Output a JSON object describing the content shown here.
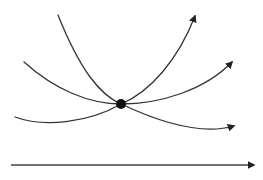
{
  "diagram": {
    "type": "trajectory-diagram",
    "colors": {
      "stroke": "#333333",
      "node": "#111111",
      "background": "#ffffff"
    },
    "node": {
      "name": "intersection-point",
      "cx": 121,
      "cy": 104,
      "r": 5
    },
    "curves": [
      {
        "name": "steep-curve",
        "d": "M58,15 C80,70 100,95 121,104 C150,92 178,60 195,16",
        "arrow_at": [
          196,
          13
        ]
      },
      {
        "name": "medium-curve",
        "d": "M24,62 C55,90 90,104 121,104 C160,104 205,90 232,62",
        "arrow_at": [
          234,
          60
        ]
      },
      {
        "name": "shallow-curve",
        "d": "M15,117 C45,128 90,122 121,104 C155,120 200,136 234,126",
        "arrow_at": [
          237,
          125
        ]
      }
    ],
    "axis": {
      "name": "horizontal-axis",
      "x1": 11,
      "y1": 165,
      "x2": 254,
      "y2": 165
    }
  }
}
